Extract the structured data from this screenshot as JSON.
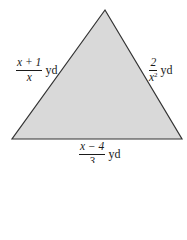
{
  "figure": {
    "shape": "triangle",
    "fill_color": "#d9d9d9",
    "stroke_color": "#333333",
    "vertices": {
      "top": [
        105,
        10
      ],
      "bottom_left": [
        12,
        139
      ],
      "bottom_right": [
        182,
        139
      ]
    }
  },
  "labels": {
    "left_side": {
      "numerator": "x + 1",
      "denominator": "x",
      "unit": "yd"
    },
    "right_side": {
      "numerator": "2",
      "denominator": "x",
      "denominator_exp": "2",
      "unit": "yd"
    },
    "bottom_side": {
      "numerator": "x − 4",
      "denominator": "3",
      "unit": "yd"
    }
  }
}
